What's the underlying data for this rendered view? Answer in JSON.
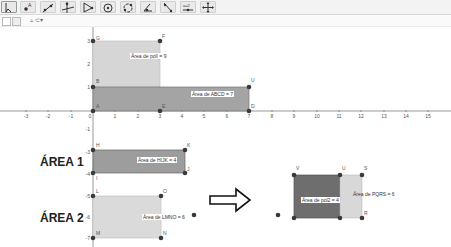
{
  "toolbar": {
    "tools": [
      {
        "name": "move-tool",
        "icon": "arrow-icon"
      },
      {
        "name": "point-tool",
        "icon": "point-icon"
      },
      {
        "name": "line-tool",
        "icon": "line-icon"
      },
      {
        "name": "perpendicular-tool",
        "icon": "perpendicular-icon"
      },
      {
        "name": "polygon-tool",
        "icon": "polygon-icon"
      },
      {
        "name": "circle-tool",
        "icon": "circle-icon"
      },
      {
        "name": "circle-three-points-tool",
        "icon": "arc-icon"
      },
      {
        "name": "angle-tool",
        "icon": "angle-icon"
      },
      {
        "name": "reflect-tool",
        "icon": "reflect-icon"
      },
      {
        "name": "slider-tool",
        "icon": "slider-icon",
        "label": "a=2"
      },
      {
        "name": "move-view-tool",
        "icon": "move-view-icon"
      }
    ]
  },
  "stylebar": {
    "items": [
      "grid-toggle",
      "axes-toggle",
      "point-capture"
    ]
  },
  "axes": {
    "x_ticks": [
      "-3",
      "-2",
      "-1",
      "0",
      "1",
      "2",
      "3",
      "4",
      "5",
      "6",
      "7",
      "8",
      "9",
      "10",
      "11",
      "12",
      "13",
      "14",
      "15"
    ],
    "y_ticks_top": [
      "3",
      "2",
      "1"
    ],
    "y_ticks_bottom": [
      "-1",
      "-3",
      "-4",
      "-5",
      "-6",
      "-7"
    ]
  },
  "shapes": {
    "poll": {
      "label": "Área de polí = 9",
      "vertices": [
        "G",
        "F",
        "B",
        "E"
      ]
    },
    "abcd": {
      "label": "Área de  ABCD = 7",
      "vertices": [
        "B",
        "U",
        "D",
        "A"
      ]
    },
    "hijk": {
      "label": "Área de  HIJK = 4",
      "vertices": [
        "H",
        "K",
        "J",
        "I"
      ]
    },
    "lmno": {
      "label": "Área de  LMNO = 6",
      "vertices": [
        "L",
        "O",
        "N",
        "M"
      ]
    },
    "pol2": {
      "label": "Área de pol2 = 4",
      "vertices": [
        "V",
        "U",
        "T",
        "W"
      ]
    },
    "pqrs": {
      "label": "Área de  PQRS = 6",
      "vertices": [
        "U",
        "S",
        "R",
        "T"
      ]
    }
  },
  "headings": {
    "area1": "ÁREA 1",
    "area2": "ÁREA 2"
  },
  "colors": {
    "dark_fill": "#7a7a7a",
    "mid_fill": "#a9a9a9",
    "light_fill": "#d3d3d3",
    "point": "#3a3a3a"
  }
}
